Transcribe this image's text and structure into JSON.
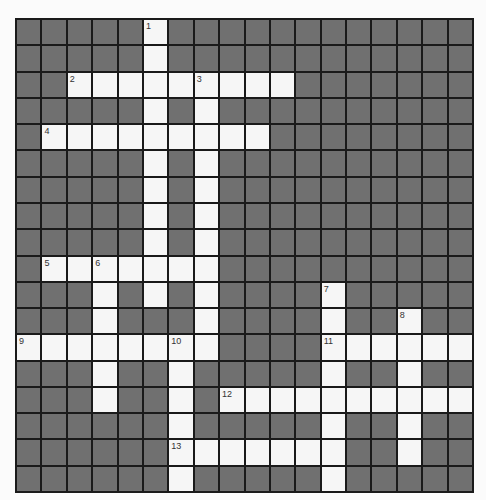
{
  "puzzle": {
    "rows": 18,
    "cols": 18,
    "colors": {
      "block": "#707070",
      "open": "#f6f6f6",
      "line": "#1a1a1a",
      "number": "#333333"
    },
    "open_cells": [
      [
        0,
        5
      ],
      [
        1,
        5
      ],
      [
        2,
        2
      ],
      [
        2,
        3
      ],
      [
        2,
        4
      ],
      [
        2,
        5
      ],
      [
        2,
        6
      ],
      [
        2,
        7
      ],
      [
        2,
        8
      ],
      [
        2,
        9
      ],
      [
        2,
        10
      ],
      [
        3,
        5
      ],
      [
        3,
        7
      ],
      [
        4,
        1
      ],
      [
        4,
        2
      ],
      [
        4,
        3
      ],
      [
        4,
        4
      ],
      [
        4,
        5
      ],
      [
        4,
        6
      ],
      [
        4,
        7
      ],
      [
        4,
        8
      ],
      [
        4,
        9
      ],
      [
        5,
        5
      ],
      [
        5,
        7
      ],
      [
        6,
        5
      ],
      [
        6,
        7
      ],
      [
        7,
        5
      ],
      [
        7,
        7
      ],
      [
        8,
        5
      ],
      [
        8,
        7
      ],
      [
        9,
        1
      ],
      [
        9,
        2
      ],
      [
        9,
        3
      ],
      [
        9,
        4
      ],
      [
        9,
        5
      ],
      [
        9,
        6
      ],
      [
        9,
        7
      ],
      [
        10,
        3
      ],
      [
        10,
        5
      ],
      [
        10,
        7
      ],
      [
        10,
        12
      ],
      [
        11,
        3
      ],
      [
        11,
        7
      ],
      [
        11,
        12
      ],
      [
        11,
        15
      ],
      [
        12,
        0
      ],
      [
        12,
        1
      ],
      [
        12,
        2
      ],
      [
        12,
        3
      ],
      [
        12,
        4
      ],
      [
        12,
        5
      ],
      [
        12,
        6
      ],
      [
        12,
        7
      ],
      [
        12,
        12
      ],
      [
        12,
        13
      ],
      [
        12,
        14
      ],
      [
        12,
        15
      ],
      [
        12,
        16
      ],
      [
        12,
        17
      ],
      [
        13,
        3
      ],
      [
        13,
        6
      ],
      [
        13,
        12
      ],
      [
        13,
        15
      ],
      [
        14,
        3
      ],
      [
        14,
        6
      ],
      [
        14,
        8
      ],
      [
        14,
        9
      ],
      [
        14,
        10
      ],
      [
        14,
        11
      ],
      [
        14,
        12
      ],
      [
        14,
        13
      ],
      [
        14,
        14
      ],
      [
        14,
        15
      ],
      [
        14,
        16
      ],
      [
        14,
        17
      ],
      [
        15,
        6
      ],
      [
        15,
        12
      ],
      [
        15,
        15
      ],
      [
        16,
        6
      ],
      [
        16,
        7
      ],
      [
        16,
        8
      ],
      [
        16,
        9
      ],
      [
        16,
        10
      ],
      [
        16,
        11
      ],
      [
        16,
        12
      ],
      [
        16,
        15
      ],
      [
        17,
        6
      ],
      [
        17,
        12
      ]
    ],
    "clue_numbers": [
      {
        "n": "1",
        "row": 0,
        "col": 5
      },
      {
        "n": "2",
        "row": 2,
        "col": 2
      },
      {
        "n": "3",
        "row": 2,
        "col": 7
      },
      {
        "n": "4",
        "row": 4,
        "col": 1
      },
      {
        "n": "5",
        "row": 9,
        "col": 1
      },
      {
        "n": "6",
        "row": 9,
        "col": 3
      },
      {
        "n": "7",
        "row": 10,
        "col": 12
      },
      {
        "n": "8",
        "row": 11,
        "col": 15
      },
      {
        "n": "9",
        "row": 12,
        "col": 0
      },
      {
        "n": "10",
        "row": 12,
        "col": 6
      },
      {
        "n": "11",
        "row": 12,
        "col": 12
      },
      {
        "n": "12",
        "row": 14,
        "col": 8
      },
      {
        "n": "13",
        "row": 16,
        "col": 6
      }
    ]
  }
}
